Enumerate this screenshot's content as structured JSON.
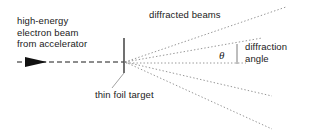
{
  "diagram": {
    "background_color": "#ffffff",
    "ink_color": "#1a1a1a",
    "ray_color": "#8a8a8a",
    "labels": {
      "source_beam_line1": "high-energy",
      "source_beam_line2": "electron beam",
      "source_beam_line3": "from accelerator",
      "diffracted_beams": "diffracted beams",
      "diffraction_angle_line1": "diffraction",
      "diffraction_angle_line2": "angle",
      "thin_foil_target": "thin foil target",
      "theta_symbol": "θ"
    },
    "geometry": {
      "scatter_vertex": {
        "x": 125,
        "y": 62
      },
      "foil_line": {
        "x": 124,
        "y_top": 38,
        "y_bottom": 73
      },
      "incident_beam": {
        "x_start": 17,
        "x_end": 124,
        "y": 62
      },
      "arrowhead": {
        "x_start": 25,
        "x_end": 47,
        "y": 62,
        "half_height": 5
      },
      "axis_dotted": {
        "x_start": 126,
        "x_end": 246,
        "y": 63
      },
      "angle_bracket": {
        "x": 237,
        "y_top": 44,
        "y_bottom": 64
      },
      "leader_thin_foil": {
        "x1": 124,
        "y1": 73,
        "x2": 112,
        "y2": 88
      },
      "diffracted_rays": [
        {
          "name": "ray-up-far",
          "x2": 286,
          "y2": 7
        },
        {
          "name": "ray-up-near",
          "x2": 262,
          "y2": 38
        },
        {
          "name": "ray-down-near",
          "x2": 272,
          "y2": 96
        },
        {
          "name": "ray-down-far",
          "x2": 272,
          "y2": 129
        }
      ]
    }
  }
}
